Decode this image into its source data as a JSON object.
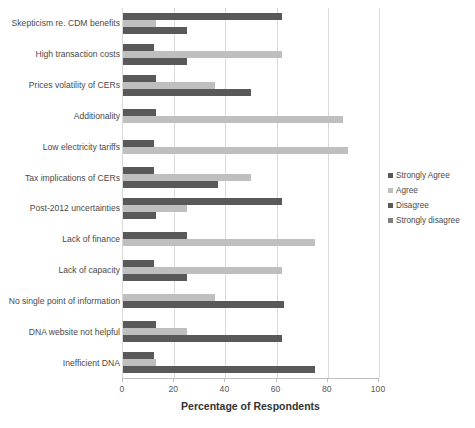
{
  "chart_data": {
    "type": "bar",
    "orientation": "horizontal",
    "title": "",
    "xlabel": "Percentage of Respondents",
    "ylabel": "",
    "xlim": [
      0,
      100
    ],
    "xticks": [
      0,
      20,
      40,
      60,
      80,
      100
    ],
    "grid": "vertical",
    "legend_position": "right",
    "categories": [
      "Skepticism re. CDM benefits",
      "High transaction costs",
      "Prices volatility of CERs",
      "Additionality",
      "Low electricity tariffs",
      "Tax implications of CERs",
      "Post-2012 uncertainties",
      "Lack of finance",
      "Lack of capacity",
      "No single point of information",
      "DNA website not helpful",
      "Inefficient DNA"
    ],
    "series": [
      {
        "name": "Strongly Agree",
        "color": "#595959",
        "values": [
          62,
          12,
          13,
          13,
          12,
          12,
          62,
          25,
          12,
          0,
          13,
          12
        ]
      },
      {
        "name": "Agree",
        "color": "#bfbfbf",
        "values": [
          13,
          62,
          36,
          86,
          88,
          50,
          25,
          75,
          62,
          36,
          25,
          13
        ]
      },
      {
        "name": "Disagree",
        "color": "#595959",
        "values": [
          25,
          25,
          50,
          0,
          0,
          37,
          13,
          0,
          25,
          63,
          62,
          75
        ]
      },
      {
        "name": "Strongly disagree",
        "color": "#808080",
        "values": [
          0,
          0,
          0,
          0,
          0,
          0,
          0,
          0,
          0,
          0,
          0,
          0
        ]
      }
    ]
  },
  "legend": {
    "items": [
      {
        "label": "Strongly Agree",
        "color": "#595959"
      },
      {
        "label": "Agree",
        "color": "#bfbfbf"
      },
      {
        "label": "Disagree",
        "color": "#595959"
      },
      {
        "label": "Strongly disagree",
        "color": "#808080"
      }
    ]
  }
}
